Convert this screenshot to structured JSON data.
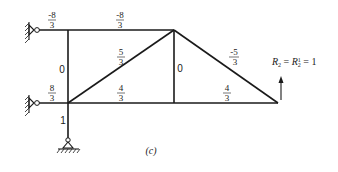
{
  "diagram": {
    "caption": "(c)",
    "members": {
      "top_left": {
        "num": "-8",
        "den": "3"
      },
      "top_right": {
        "num": "-8",
        "den": "3"
      },
      "vertical_left": "0",
      "diagonal_left": {
        "num": "5",
        "den": "3"
      },
      "vertical_middle": "0",
      "diagonal_right": {
        "num": "-5",
        "den": "3"
      },
      "bottom_left_link": {
        "num": "8",
        "den": "3"
      },
      "bottom_middle": {
        "num": "4",
        "den": "3"
      },
      "bottom_right": {
        "num": "4",
        "den": "3"
      },
      "support_post": "1"
    },
    "reaction": {
      "R": "R",
      "sub2": "2",
      "eq1": " = ",
      "R1": "R",
      "sub_a": "2",
      "sup_a": "1",
      "eq2": " = 1"
    },
    "icons": {
      "top_wall_support": "pin-roller-wall-support",
      "middle_wall_support": "pin-roller-wall-support",
      "bottom_ground_support": "pin-ground-support",
      "load_arrow": "arrow-up"
    }
  }
}
